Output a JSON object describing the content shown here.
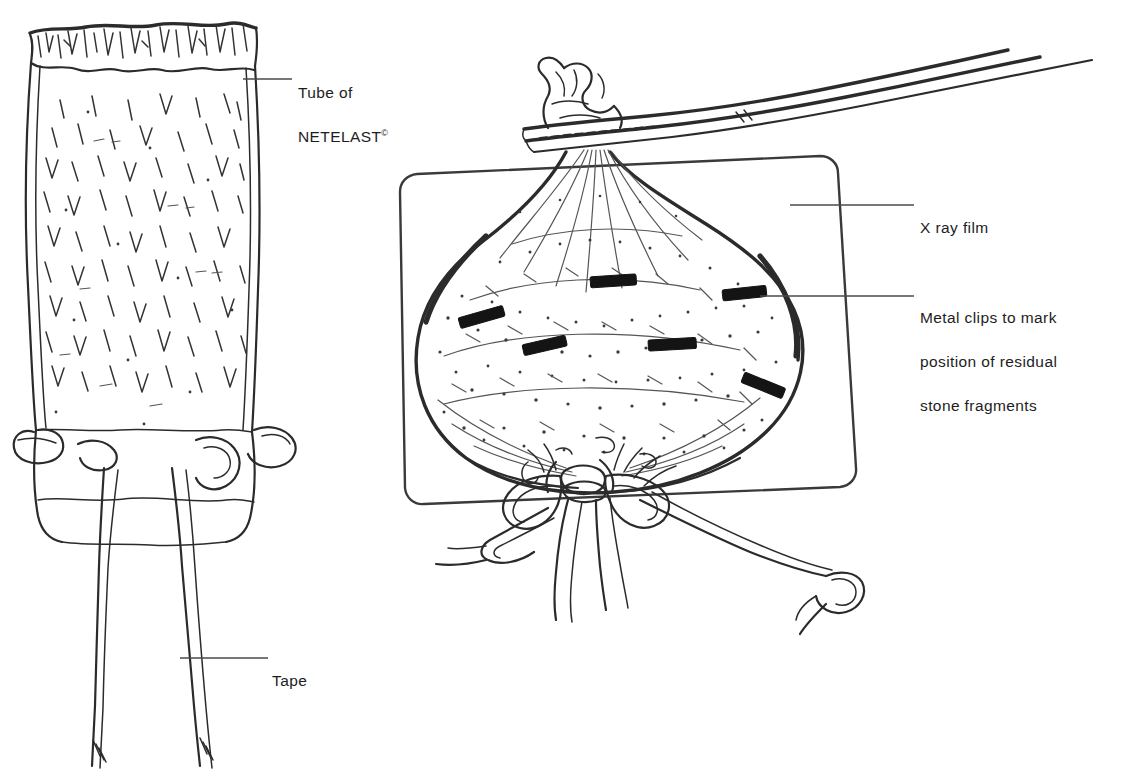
{
  "figure": {
    "medium": "line-drawing",
    "background_color": "#ffffff",
    "ink_color": "#2b2b2b",
    "clip_color": "#141414",
    "width": 1134,
    "height": 784
  },
  "callouts": [
    {
      "id": "netelast",
      "line1": "Tube of",
      "line2": "NETELAST",
      "symbol": "©",
      "leader": "horizontal-line-left",
      "target": "left-figure-netting-tube"
    },
    {
      "id": "tape",
      "line1": "Tape",
      "leader": "horizontal-line-left",
      "target": "left-figure-tape-strand"
    },
    {
      "id": "xray",
      "line1": "X ray film",
      "leader": "horizontal-line-left",
      "target": "right-figure-film-sheet"
    },
    {
      "id": "clips",
      "line1": "Metal clips to mark",
      "line2": "position of residual",
      "line3": "stone fragments",
      "leader": "horizontal-line-left",
      "target": "right-figure-metal-clip"
    }
  ],
  "left_figure": {
    "name": "netelast-tube",
    "description": "Open cylindrical tube of elastic netting with frayed scalloped top edge, diamond mesh texture, tape loops threaded through the lower rim and two long tape ends hanging below",
    "parts": [
      "frayed-top-edge",
      "mesh-body",
      "tape-loops",
      "tape-strands"
    ]
  },
  "right_figure": {
    "name": "loaded-bag-on-film",
    "description": "Heart shaped netting bag filled with stippled contents, gathered neck held in forceps above, tied with tape bow below, lying on a rounded-corner X ray film sheet",
    "parts": [
      "forceps",
      "gathered-neck",
      "bag-body",
      "stipple-texture",
      "metal-clips",
      "tape-bow",
      "tape-trails",
      "x-ray-film"
    ],
    "metal_clip_count": 6
  }
}
